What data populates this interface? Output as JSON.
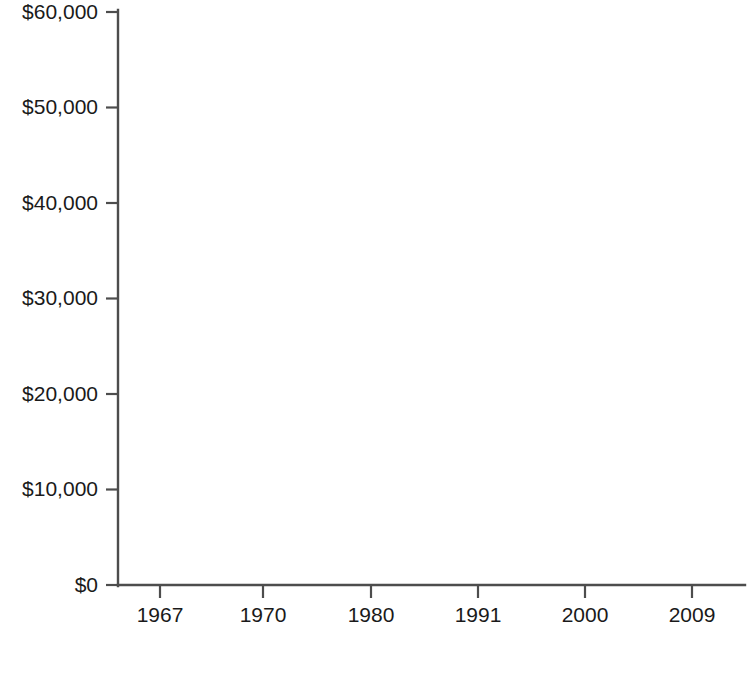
{
  "chart_data": {
    "type": "line",
    "title": "",
    "subtitle": "",
    "xlabel": "",
    "ylabel": "",
    "categories": [
      "1967",
      "1970",
      "1980",
      "1991",
      "2000",
      "2009"
    ],
    "x": [
      1967,
      1970,
      1980,
      1991,
      2000,
      2009
    ],
    "series": [
      {
        "name": "White (non-Hispanic)",
        "values": [
          34900,
          37500,
          40400,
          43700,
          49000,
          55900
        ],
        "color": "#767676",
        "line_style": "solid",
        "marker": "diamond"
      },
      {
        "name": "Black",
        "values": [
          20300,
          22700,
          22800,
          25600,
          31800,
          35300
        ],
        "color": "#767676",
        "line_style": "dashed",
        "marker": "square"
      }
    ],
    "ylim": [
      0,
      60000
    ],
    "ytick_values": [
      0,
      10000,
      20000,
      30000,
      40000,
      50000,
      60000
    ],
    "ytick_labels": [
      "$0",
      "$10,000",
      "$20,000",
      "$30,000",
      "$40,000",
      "$50,000",
      "$60,000"
    ],
    "xtick_labels": [
      "1967",
      "1970",
      "1980",
      "1991",
      "2000",
      "2009"
    ],
    "grid": false,
    "legend_position": "bottom",
    "legend_entries": [
      {
        "label": "White (non-Hispanic)",
        "marker": "diamond",
        "line_style": "solid",
        "color": "#767676"
      },
      {
        "label": "Black",
        "marker": "square",
        "line_style": "dashed",
        "color": "#767676"
      }
    ],
    "background_color": "#ffffff",
    "axis_color": "#4d4d4d",
    "text_color": "#1a1a1a"
  }
}
